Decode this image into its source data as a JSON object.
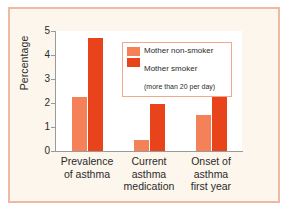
{
  "chart_data": {
    "type": "bar",
    "title": "",
    "xlabel": "",
    "ylabel": "Percentage",
    "ylim": [
      0,
      5
    ],
    "yticks": [
      "0",
      "1",
      "2",
      "3",
      "4",
      "5"
    ],
    "grid": false,
    "legend_position": "upper-center-right",
    "categories": [
      "Prevalence of asthma",
      "Current asthma medication",
      "Onset of asthma first year"
    ],
    "category_lines": [
      [
        "Prevalence",
        "of asthma"
      ],
      [
        "Current",
        "asthma",
        "medication"
      ],
      [
        "Onset of",
        "asthma",
        "first year"
      ]
    ],
    "series": [
      {
        "name": "Mother non-smoker",
        "color": "#f58158",
        "values": [
          2.25,
          0.45,
          1.5
        ]
      },
      {
        "name": "Mother smoker",
        "color": "#e8431a",
        "values": [
          4.7,
          1.95,
          4.4
        ]
      }
    ]
  },
  "legend": {
    "entries": [
      {
        "label": "Mother non-smoker",
        "sublabel": ""
      },
      {
        "label": "Mother smoker",
        "sublabel": "(more than 20 per day)"
      }
    ]
  },
  "colors": {
    "light_orange": "#f58158",
    "dark_orange": "#e8431a",
    "frame_border": "#f0b9a4",
    "figure_background": "#fdf6ec",
    "plot_background": "#ffffff",
    "axis_gray": "#9a9a9a"
  }
}
